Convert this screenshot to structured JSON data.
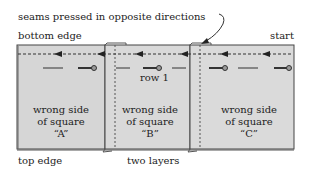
{
  "diagram": {
    "annotation_top": "seams pressed in opposite directions",
    "label_bottom_edge": "bottom edge",
    "label_start": "start",
    "label_row": "row 1",
    "label_top_edge": "top edge",
    "label_two_layers": "two layers",
    "squares": [
      {
        "line1": "wrong side",
        "line2": "of square",
        "line3": "“A”"
      },
      {
        "line1": "wrong side",
        "line2": "of square",
        "line3": "“B”"
      },
      {
        "line1": "wrong side",
        "line2": "of square",
        "line3": "“C”"
      }
    ],
    "colors": {
      "fabric": "#d9d9d9",
      "outline": "#444444",
      "stitch": "#333333"
    }
  }
}
